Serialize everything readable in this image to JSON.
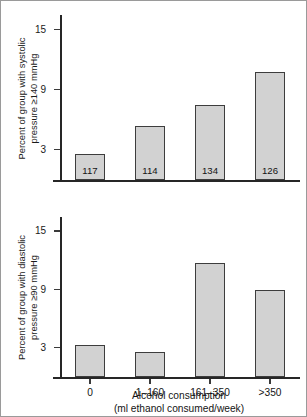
{
  "chart_data": [
    {
      "type": "bar",
      "panel": "top",
      "title": "",
      "ylabel_line1": "Percent of group with systolic",
      "ylabel_line2": "pressure ≥140 mmHg",
      "xlabel": "",
      "categories": [
        "0",
        "1–160",
        "161–350",
        ">350"
      ],
      "values": [
        2.6,
        5.4,
        7.5,
        10.8
      ],
      "bar_labels": [
        "117",
        "114",
        "134",
        "126"
      ],
      "yticks": [
        3,
        9,
        15
      ],
      "ytick_labels": [
        "3",
        "9",
        "15"
      ],
      "ylim": [
        0,
        16.5
      ],
      "grid": false,
      "legend": "none",
      "bar_fill": "#d2d2d2",
      "bar_edge": "#3d3d3d"
    },
    {
      "type": "bar",
      "panel": "bottom",
      "title": "",
      "ylabel_line1": "Percent of group with diastolic",
      "ylabel_line2": "pressure ≥90 mmHg",
      "xlabel_line1": "Alcohol consumption",
      "xlabel_line2": "(ml ethanol consumed/week)",
      "categories": [
        "0",
        "1–160",
        "161–350",
        ">350"
      ],
      "values": [
        3.3,
        2.6,
        11.8,
        9.0
      ],
      "bar_labels": [
        "",
        "",
        "",
        ""
      ],
      "yticks": [
        3,
        9,
        15
      ],
      "ytick_labels": [
        "3",
        "9",
        "15"
      ],
      "ylim": [
        0,
        16.5
      ],
      "grid": false,
      "legend": "none",
      "bar_fill": "#d2d2d2",
      "bar_edge": "#3d3d3d"
    }
  ]
}
